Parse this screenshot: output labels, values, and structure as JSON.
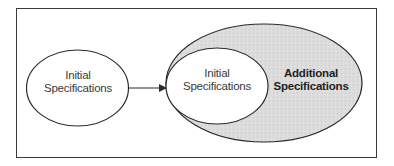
{
  "diagram": {
    "left_node": {
      "line1": "Initial",
      "line2": "Specifications"
    },
    "inner_node": {
      "line1": "Initial",
      "line2": "Specifications"
    },
    "outer_node": {
      "line1": "Additional",
      "line2": "Specifications"
    },
    "colors": {
      "stroke": "#2a2a2a",
      "outer_fill": "#d9d9d9",
      "inner_fill": "#ffffff",
      "background": "#ffffff"
    }
  }
}
